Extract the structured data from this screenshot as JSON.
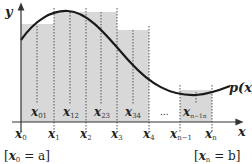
{
  "diagram": {
    "colors": {
      "bar_fill": "#d8d8d8",
      "curve": "#1a1a1a",
      "axis": "#333333",
      "dotted": "#555555"
    },
    "axes": {
      "y_label": "y",
      "x_label": "x"
    },
    "curve_label": "p(x)",
    "ellipsis": "...",
    "ticks": [
      {
        "main": "x",
        "sub": "0"
      },
      {
        "main": "x",
        "sub": "1"
      },
      {
        "main": "x",
        "sub": "2"
      },
      {
        "main": "x",
        "sub": "3"
      },
      {
        "main": "x",
        "sub": "4"
      },
      {
        "main": "x",
        "sub": "n−1"
      },
      {
        "main": "x",
        "sub": "n"
      }
    ],
    "midpoints": [
      {
        "main": "x",
        "sub": "01"
      },
      {
        "main": "x",
        "sub": "12"
      },
      {
        "main": "x",
        "sub": "23"
      },
      {
        "main": "x",
        "sub": "34"
      },
      {
        "main": "x",
        "sub": "n−1n"
      }
    ],
    "bounds": {
      "left": {
        "open": "[",
        "main": "x",
        "sub": "0",
        "rest": " = a]"
      },
      "right": {
        "open": "[",
        "main": "x",
        "sub": "n",
        "rest": " = b]"
      }
    }
  }
}
